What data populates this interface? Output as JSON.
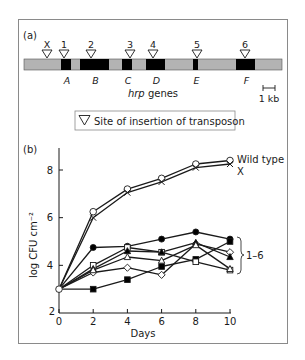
{
  "panel_a": {
    "label": "(a)",
    "insertion_labels": [
      "X",
      "1",
      "2",
      "3",
      "4",
      "5",
      "6"
    ],
    "gene_labels": [
      "A",
      "B",
      "C",
      "D",
      "E",
      "F"
    ],
    "genes_caption_italic": "hrp",
    "genes_caption_rest": " genes",
    "scale_bar_label": "1 kb",
    "legend_text": "Site of insertion of transposon",
    "colors": {
      "region": "#b3b3b3",
      "gene": "#000000"
    }
  },
  "panel_b": {
    "label": "(b)",
    "right_labels": {
      "wild_type": "Wild type",
      "x": "X",
      "mutants": "1–6"
    }
  },
  "chart_data": {
    "type": "line",
    "title": "",
    "xlabel": "Days",
    "ylabel": "log CFU cm⁻²",
    "x": [
      0,
      2,
      4,
      6,
      8,
      10
    ],
    "xticks": [
      "0",
      "2",
      "4",
      "6",
      "8",
      "10"
    ],
    "yticks": [
      "2",
      "4",
      "6",
      "8"
    ],
    "xlim": [
      0,
      10
    ],
    "ylim": [
      2,
      9
    ],
    "grid": false,
    "legend_position": "right (direct labels)",
    "series": [
      {
        "name": "Wild type",
        "marker": "open-circle",
        "values": [
          3.0,
          6.25,
          7.2,
          7.65,
          8.25,
          8.4
        ]
      },
      {
        "name": "X",
        "marker": "cross",
        "values": [
          3.0,
          6.0,
          7.05,
          7.5,
          8.1,
          8.25
        ]
      },
      {
        "name": "Mutant (filled circle)",
        "group": "1–6",
        "marker": "filled-circle",
        "values": [
          3.0,
          4.75,
          4.8,
          5.1,
          5.4,
          5.1
        ]
      },
      {
        "name": "Mutant (filled square)",
        "group": "1–6",
        "marker": "filled-square",
        "values": [
          3.0,
          3.0,
          3.4,
          3.95,
          4.25,
          5.0
        ]
      },
      {
        "name": "Mutant (open diamond)",
        "group": "1–6",
        "marker": "open-diamond",
        "values": [
          3.0,
          3.7,
          3.9,
          3.6,
          4.9,
          4.55
        ]
      },
      {
        "name": "Mutant (open square)",
        "group": "1–6",
        "marker": "open-square",
        "values": [
          3.0,
          4.0,
          4.75,
          4.55,
          4.15,
          3.8
        ]
      },
      {
        "name": "Mutant (filled triangle)",
        "group": "1–6",
        "marker": "filled-triangle",
        "values": [
          3.0,
          3.85,
          4.6,
          4.55,
          4.95,
          4.35
        ]
      },
      {
        "name": "Mutant (open triangle)",
        "group": "1–6",
        "marker": "open-triangle",
        "values": [
          3.0,
          3.8,
          4.35,
          4.2,
          4.85,
          3.85
        ]
      }
    ]
  }
}
